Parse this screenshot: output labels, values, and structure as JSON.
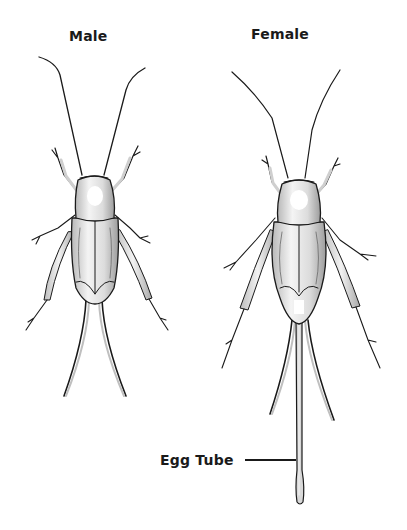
{
  "diagram": {
    "labels": {
      "male": "Male",
      "female": "Female",
      "egg_tube": "Egg Tube"
    },
    "colors": {
      "ink": "#1a1a1a",
      "body_fill": "#e4e4e4",
      "highlight": "#ffffff",
      "shade": "#9a9a9a"
    }
  }
}
